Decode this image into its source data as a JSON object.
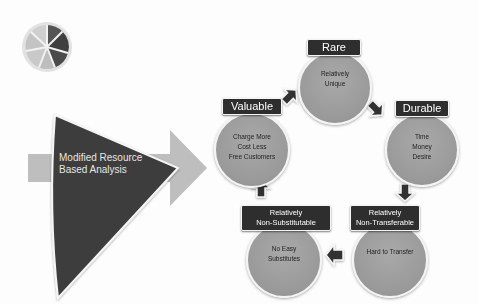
{
  "diagram": {
    "title_shape": {
      "label_line1": "Modified Resource",
      "label_line2": "Based Analysis"
    },
    "nodes": [
      {
        "id": "rare",
        "label": "Rare",
        "text": [
          "Relatively",
          "Unique"
        ]
      },
      {
        "id": "durable",
        "label": "Durable",
        "text": [
          "Time",
          "Money",
          "Desire"
        ]
      },
      {
        "id": "non-transferable",
        "label_line1": "Relatively",
        "label_line2": "Non-Transferable",
        "text": [
          "Hard to Transfer"
        ]
      },
      {
        "id": "non-substitutable",
        "label_line1": "Relatively",
        "label_line2": "Non-Substitutable",
        "text": [
          "No Easy",
          "Substitutes"
        ]
      },
      {
        "id": "valuable",
        "label": "Valuable",
        "text": [
          "Charge More",
          "Cost Less",
          "Free Customers"
        ]
      }
    ],
    "cycle_order": [
      "valuable",
      "rare",
      "durable",
      "non-transferable",
      "non-substitutable",
      "valuable"
    ],
    "colors": {
      "label_bg": "#2e2e2e",
      "circle_fill": "#9d9d9d",
      "arrow_dark": "#3a3a3a",
      "big_arrow": "#bdbdbd",
      "triangle": "#3d3d3d"
    },
    "icon": "pie-chart-icon"
  }
}
